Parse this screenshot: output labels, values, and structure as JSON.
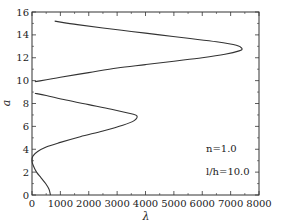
{
  "chart_data": {
    "type": "line",
    "title": "",
    "xlabel": "λ",
    "ylabel": "a",
    "xlim": [
      0,
      8000
    ],
    "ylim": [
      0,
      16
    ],
    "xticks": [
      0,
      1000,
      2000,
      3000,
      4000,
      5000,
      6000,
      7000,
      8000
    ],
    "yticks": [
      0,
      2,
      4,
      6,
      8,
      10,
      12,
      14,
      16
    ],
    "grid": false,
    "legend": null,
    "annotations": [
      "n=1.0",
      "l/h=10.0"
    ],
    "series": [
      {
        "name": "branch-1",
        "points": [
          [
            650,
            0.0
          ],
          [
            600,
            0.5
          ],
          [
            480,
            1.0
          ],
          [
            320,
            1.5
          ],
          [
            160,
            2.0
          ],
          [
            40,
            2.6
          ],
          [
            0,
            3.0
          ],
          [
            30,
            3.4
          ],
          [
            200,
            3.8
          ],
          [
            500,
            4.2
          ],
          [
            1000,
            4.6
          ],
          [
            1700,
            5.1
          ],
          [
            2500,
            5.6
          ],
          [
            3200,
            6.1
          ],
          [
            3600,
            6.5
          ],
          [
            3700,
            6.9
          ],
          [
            3500,
            7.1
          ],
          [
            2800,
            7.5
          ],
          [
            2000,
            7.9
          ],
          [
            1200,
            8.3
          ],
          [
            500,
            8.7
          ],
          [
            100,
            8.9
          ]
        ]
      },
      {
        "name": "branch-2",
        "points": [
          [
            100,
            9.9
          ],
          [
            1000,
            10.3
          ],
          [
            2000,
            10.7
          ],
          [
            3000,
            11.1
          ],
          [
            4000,
            11.4
          ],
          [
            5000,
            11.7
          ],
          [
            6000,
            12.0
          ],
          [
            6800,
            12.3
          ],
          [
            7300,
            12.6
          ],
          [
            7400,
            12.8
          ],
          [
            7200,
            13.1
          ],
          [
            6500,
            13.4
          ],
          [
            5500,
            13.7
          ],
          [
            4500,
            14.0
          ],
          [
            3500,
            14.3
          ],
          [
            2500,
            14.6
          ],
          [
            1600,
            14.9
          ],
          [
            800,
            15.2
          ]
        ]
      }
    ]
  },
  "axes": {
    "x_label": "λ",
    "y_label": "a",
    "x_tick_labels": [
      "0",
      "1000",
      "2000",
      "3000",
      "4000",
      "5000",
      "6000",
      "7000",
      "8000"
    ],
    "y_tick_labels": [
      "0",
      "2",
      "4",
      "6",
      "8",
      "10",
      "12",
      "14",
      "16"
    ]
  },
  "annotation": {
    "line1": "n=1.0",
    "line2": "l/h=10.0"
  },
  "colors": {
    "line": "#333333",
    "frame": "#333333",
    "background": "#ffffff"
  }
}
